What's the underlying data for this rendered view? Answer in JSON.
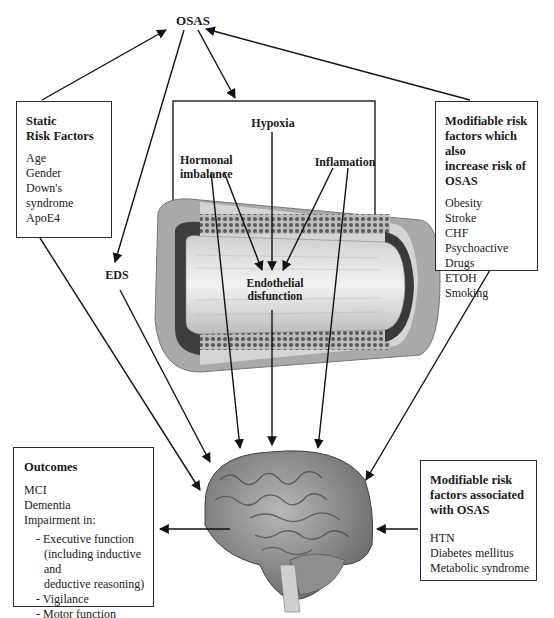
{
  "nodes": {
    "osas": "OSAS",
    "eds": "EDS",
    "static_risk": {
      "title_line1": "Static",
      "title_line2": "Risk Factors",
      "items": [
        "Age",
        "Gender",
        "Down's syndrome",
        "ApoE4"
      ]
    },
    "modifiable_increase": {
      "title_lines": [
        "Modifiable risk",
        "factors which also",
        "increase risk of",
        "OSAS"
      ],
      "items": [
        "Obesity",
        "Stroke",
        "CHF",
        "Psychoactive Drugs",
        "ETOH",
        "Smoking"
      ]
    },
    "vessel_panel": {
      "hypoxia": "Hypoxia",
      "hormonal_line1": "Hormonal",
      "hormonal_line2": "imbalance",
      "inflamation": "Inflamation",
      "endothelial_line1": "Endothelial",
      "endothelial_line2": "disfunction"
    },
    "outcomes": {
      "title": "Outcomes",
      "items": [
        "MCI",
        "Dementia",
        "Impairment in:"
      ],
      "sub_items": [
        "- Executive function",
        "(including inductive and",
        "deductive reasoning)",
        "- Vigilance",
        "- Motor function"
      ]
    },
    "modifiable_associated": {
      "title_lines": [
        "Modifiable risk",
        "factors associated",
        "with OSAS"
      ],
      "items": [
        "HTN",
        "Diabetes mellitus",
        "Metabolic syndrome"
      ]
    }
  },
  "illustrations": {
    "vessel": "blood-vessel-cross-section",
    "brain": "human-brain-lateral-view"
  }
}
